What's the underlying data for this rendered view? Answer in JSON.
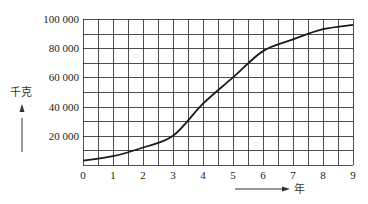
{
  "chart_data": {
    "type": "line",
    "title": "",
    "xlabel": "年",
    "ylabel": "千克",
    "x": [
      0,
      1,
      2,
      3,
      4,
      5,
      6,
      7,
      8,
      9
    ],
    "series": [
      {
        "name": "growth",
        "values": [
          3000,
          6000,
          12000,
          20000,
          42000,
          60000,
          78000,
          86000,
          93000,
          96000
        ]
      }
    ],
    "xticks": [
      "0",
      "1",
      "2",
      "3",
      "4",
      "5",
      "6",
      "7",
      "8",
      "9"
    ],
    "yticks": [
      "20 000",
      "40 000",
      "60 000",
      "80 000",
      "100 000"
    ],
    "ytick_values": [
      20000,
      40000,
      60000,
      80000,
      100000
    ],
    "xlim": [
      0,
      9
    ],
    "ylim": [
      0,
      100000
    ],
    "grid": true,
    "grid_minor_x": 0.5,
    "grid_minor_y": 10000,
    "legend": "none",
    "line_color": "#1a1a1a",
    "grid_color": "#222222"
  }
}
